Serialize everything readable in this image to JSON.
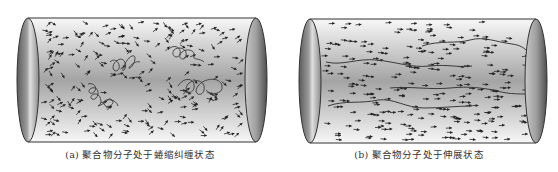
{
  "figure": {
    "panels": [
      {
        "id": "a",
        "label": "(a)",
        "caption": "(a) 聚合物分子处于蜷缩纠缠状态",
        "state": "coiled-entangled",
        "arrow_orientation": "random",
        "chain_count": 4
      },
      {
        "id": "b",
        "label": "(b)",
        "caption": "(b) 聚合物分子处于伸展状态",
        "state": "stretched",
        "arrow_orientation": "aligned-right",
        "chain_count": 4
      }
    ],
    "colors": {
      "cylinder_outline": "#333333",
      "cylinder_fill_edge": "#f4f4f4",
      "cylinder_fill_center": "#9a9a9a",
      "end_cap_dark": "#555555",
      "end_cap_light": "#d6d6d6",
      "arrow": "#222222",
      "chain": "#3a3a3a"
    }
  }
}
